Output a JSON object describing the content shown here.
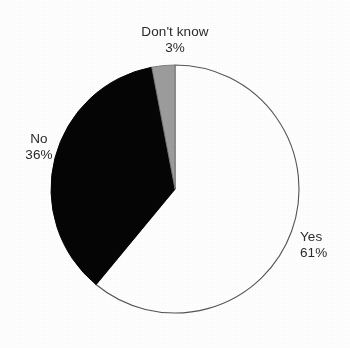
{
  "chart_data": {
    "type": "pie",
    "title": "",
    "subtitle": "",
    "xlabel": "",
    "ylabel": "",
    "legend_position": "none",
    "grid": false,
    "units": "percent",
    "start_angle_deg": 0,
    "direction": "clockwise",
    "categories": [
      "Yes",
      "No",
      "Don't know"
    ],
    "values": [
      61,
      36,
      3
    ],
    "slices": [
      {
        "label": "Yes",
        "value_label": "61%",
        "value": 61,
        "color": "#ffffff",
        "stroke": "#555555",
        "start_deg": 0,
        "end_deg": 219.6
      },
      {
        "label": "No",
        "value_label": "36%",
        "value": 36,
        "color": "#050505",
        "stroke": "#050505",
        "start_deg": 219.6,
        "end_deg": 349.2
      },
      {
        "label": "Don't know",
        "value_label": "3%",
        "value": 3,
        "color": "#9d9d9d",
        "stroke": "#777777",
        "start_deg": 349.2,
        "end_deg": 360
      }
    ],
    "geometry": {
      "center_x": 175,
      "center_y": 189,
      "radius": 124
    }
  },
  "labels": {
    "dont_know": {
      "name": "Don't know",
      "value": "3%"
    },
    "no": {
      "name": "No",
      "value": "36%"
    },
    "yes": {
      "name": "Yes",
      "value": "61%"
    }
  },
  "colors": {
    "background": "#ffffff",
    "text": "#2b2b2b",
    "yes_fill": "#ffffff",
    "no_fill": "#050505",
    "dont_know_fill": "#9d9d9d",
    "outline": "#555555"
  }
}
